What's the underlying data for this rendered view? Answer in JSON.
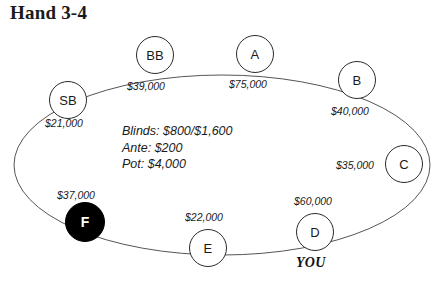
{
  "title": "Hand 3-4",
  "diagram": {
    "type": "poker-table",
    "table_shape": "ellipse",
    "dealer_seat": "F",
    "hero_seat": "D",
    "hero_label": "YOU",
    "stroke_color": "#555555",
    "node_fill": "#ffffff",
    "node_stroke": "#2b2b2b",
    "dealer_fill": "#000000",
    "dealer_text_color": "#ffffff"
  },
  "center_info": {
    "blinds": "Blinds: $800/$1,600",
    "ante": "Ante: $200",
    "pot": "Pot: $4,000"
  },
  "seats": [
    {
      "name": "SB",
      "stack": "$21,000",
      "cx": 68,
      "cy": 100,
      "lx": 45,
      "ly": 118,
      "dealer": false
    },
    {
      "name": "BB",
      "stack": "$39,000",
      "cx": 155,
      "cy": 55,
      "lx": 127,
      "ly": 81,
      "dealer": false
    },
    {
      "name": "A",
      "stack": "$75,000",
      "cx": 255,
      "cy": 54,
      "lx": 229,
      "ly": 79,
      "dealer": false
    },
    {
      "name": "B",
      "stack": "$40,000",
      "cx": 357,
      "cy": 80,
      "lx": 331,
      "ly": 106,
      "dealer": false
    },
    {
      "name": "C",
      "stack": "$35,000",
      "cx": 404,
      "cy": 164,
      "lx": 336,
      "ly": 160,
      "dealer": false
    },
    {
      "name": "D",
      "stack": "$60,000",
      "cx": 315,
      "cy": 232,
      "lx": 294,
      "ly": 196,
      "dealer": false
    },
    {
      "name": "E",
      "stack": "$22,000",
      "cx": 208,
      "cy": 248,
      "lx": 185,
      "ly": 212,
      "dealer": false
    },
    {
      "name": "F",
      "stack": "$37,000",
      "cx": 85,
      "cy": 222,
      "lx": 57,
      "ly": 190,
      "dealer": true
    }
  ]
}
